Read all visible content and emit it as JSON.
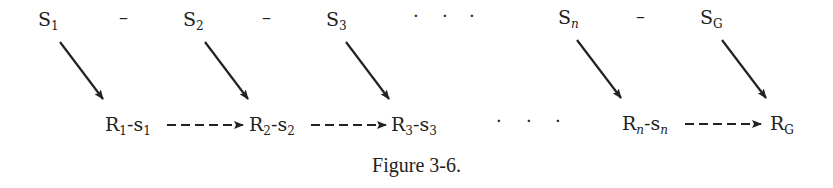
{
  "diagram": {
    "caption": "Figure 3-6.",
    "top_row": [
      {
        "base": "S",
        "sub": "1"
      },
      {
        "separator": "–"
      },
      {
        "base": "S",
        "sub": "2"
      },
      {
        "separator": "–"
      },
      {
        "base": "S",
        "sub": "3"
      },
      {
        "ellipsis": "· · ·"
      },
      {
        "base": "S",
        "sub": "n",
        "sub_italic": true
      },
      {
        "separator": "–"
      },
      {
        "base": "S",
        "sub": "G"
      }
    ],
    "bottom_row": [
      {
        "r": "R",
        "r_sub": "1",
        "s": "s",
        "s_sub": "1"
      },
      {
        "r": "R",
        "r_sub": "2",
        "s": "s",
        "s_sub": "2"
      },
      {
        "r": "R",
        "r_sub": "3",
        "s": "s",
        "s_sub": "3"
      },
      {
        "ellipsis": "· · ·"
      },
      {
        "r": "R",
        "r_sub": "n",
        "s": "s",
        "s_sub": "n",
        "italic": true
      },
      {
        "r": "R",
        "r_sub": "G"
      }
    ],
    "edges": {
      "solid": [
        {
          "from": "S1",
          "to": "R1-s1"
        },
        {
          "from": "S2",
          "to": "R2-s2"
        },
        {
          "from": "S3",
          "to": "R3-s3"
        },
        {
          "from": "Sn",
          "to": "Rn-sn"
        },
        {
          "from": "SG",
          "to": "RG"
        }
      ],
      "dashed": [
        {
          "from": "R1-s1",
          "to": "R2-s2"
        },
        {
          "from": "R2-s2",
          "to": "R3-s3"
        },
        {
          "from": "Rn-sn",
          "to": "RG"
        }
      ]
    },
    "separator": "–",
    "hyphen": "-",
    "ellipsis": "·   ·   ·"
  }
}
